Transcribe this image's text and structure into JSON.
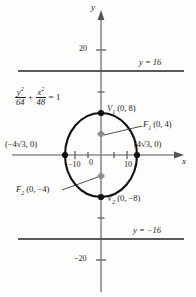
{
  "figure": {
    "kind": "ellipse-graph",
    "axes": {
      "x_axis_label": "x",
      "y_axis_label": "y",
      "origin_label": "0",
      "x_ticks": [
        {
          "value": -10,
          "label": "−10"
        },
        {
          "value": 10,
          "label": "10"
        }
      ],
      "y_ticks": [
        {
          "value": 20,
          "label": "20"
        },
        {
          "value": -20,
          "label": "−20"
        }
      ],
      "x_range": [
        -19,
        19
      ],
      "y_range": [
        -28,
        28
      ]
    },
    "equation": {
      "numerator_1": "y",
      "numerator_1_exp": "2",
      "denominator_1": "64",
      "plus": "+",
      "numerator_2": "x",
      "numerator_2_exp": "2",
      "denominator_2": "48",
      "equals": "= 1"
    },
    "labels": {
      "vertex_top": "V",
      "vertex_top_sub": "1",
      "vertex_top_coords": "(0, 8)",
      "vertex_bottom": "V",
      "vertex_bottom_sub": "2",
      "vertex_bottom_coords": "(0, −8)",
      "focus_top": "F",
      "focus_top_sub": "1",
      "focus_top_coords": "(0, 4)",
      "focus_bottom": "F",
      "focus_bottom_sub": "2",
      "focus_bottom_coords": "(0, −4)",
      "covertex_left": "(−4√3, 0)",
      "covertex_right": "(4√3, 0)",
      "directrix_top": "y = 16",
      "directrix_bottom": "y = −16"
    },
    "points": [
      {
        "name": "vertex-top",
        "x": 0,
        "y": 8,
        "style": "filled-black"
      },
      {
        "name": "vertex-bottom",
        "x": 0,
        "y": -8,
        "style": "filled-black"
      },
      {
        "name": "covertex-left",
        "x": -6.93,
        "y": 0,
        "style": "filled-black"
      },
      {
        "name": "covertex-right",
        "x": 6.93,
        "y": 0,
        "style": "filled-black"
      },
      {
        "name": "focus-top",
        "x": 0,
        "y": 4,
        "style": "filled-gray"
      },
      {
        "name": "focus-bottom",
        "x": 0,
        "y": -4,
        "style": "filled-gray"
      }
    ],
    "curve": {
      "type": "ellipse",
      "center": [
        0,
        0
      ],
      "semi_major_y": 8,
      "semi_minor_x": 6.93
    },
    "horizontal_lines": [
      {
        "y": 16,
        "label": "y = 16"
      },
      {
        "y": -16,
        "label": "y = −16"
      }
    ],
    "colors": {
      "curve": "#111111",
      "axis": "#8a8a8a",
      "directrix": "#5a5a5a",
      "point_fill": "#111111",
      "focus_fill": "#8c8c8c",
      "background": "#fdfdfb",
      "text": "#1c1c1c"
    }
  }
}
